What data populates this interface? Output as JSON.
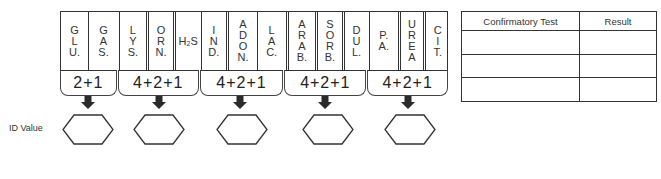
{
  "panel": {
    "groups": [
      {
        "cells": [
          {
            "label": [
              "G",
              "L",
              "U."
            ],
            "width": 27
          },
          {
            "label": [
              "G",
              "A",
              "S."
            ],
            "width": 28
          }
        ],
        "score": "2+1",
        "score_width": 57
      },
      {
        "cells": [
          {
            "label": [
              "L",
              "Y",
              "S."
            ],
            "width": 26
          },
          {
            "label": [
              "O",
              "R",
              "N."
            ],
            "width": 27
          },
          {
            "label": [
              "H₂S"
            ],
            "width": 25
          }
        ],
        "score": "4+2+1",
        "score_width": 81
      },
      {
        "cells": [
          {
            "label": [
              "I",
              "N",
              "D."
            ],
            "width": 24
          },
          {
            "label": [
              "A",
              "D",
              "O",
              "N."
            ],
            "width": 31
          },
          {
            "label": [
              "L",
              "A",
              "C."
            ],
            "width": 27
          }
        ],
        "score": "4+2+1",
        "score_width": 85
      },
      {
        "cells": [
          {
            "label": [
              "A",
              "R",
              "A",
              "B."
            ],
            "width": 27
          },
          {
            "label": [
              "S",
              "O",
              "R",
              "B."
            ],
            "width": 28
          },
          {
            "label": [
              "D",
              "U",
              "L."
            ],
            "width": 26
          }
        ],
        "score": "4+2+1",
        "score_width": 83
      },
      {
        "cells": [
          {
            "label": [
              "P.",
              "A."
            ],
            "width": 28
          },
          {
            "label": [
              "U",
              "R",
              "E",
              "A"
            ],
            "width": 26
          },
          {
            "label": [
              "C",
              "I",
              "T."
            ],
            "width": 25
          }
        ],
        "score": "4+2+1",
        "score_width": 82
      }
    ]
  },
  "id_value": {
    "label": "ID Value",
    "boxes": [
      "",
      "",
      "",
      "",
      ""
    ],
    "centers_x": [
      88,
      159,
      240,
      325,
      408
    ]
  },
  "confirmatory_table": {
    "headers": [
      "Confirmatory Test",
      "Result"
    ],
    "rows": [
      [
        "",
        ""
      ],
      [
        "",
        ""
      ],
      [
        "",
        ""
      ]
    ]
  },
  "colors": {
    "line": "#333333",
    "arrow": "#2a2a2a",
    "background": "#ffffff"
  }
}
